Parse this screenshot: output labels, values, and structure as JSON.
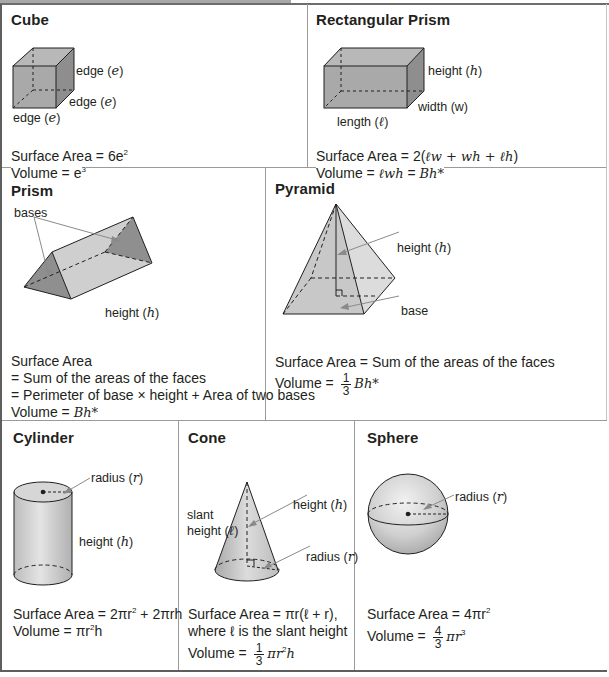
{
  "sheet": {
    "colors": {
      "shape_fill": "#a9a9a9",
      "shape_fill_light": "#d4d4d4",
      "shape_fill_dark": "#8c8c8c",
      "line": "#231f20",
      "arrow": "#8a8a8a",
      "border": "#5e5e5e",
      "divider": "#9a9a9a"
    }
  },
  "cube": {
    "title": "Cube",
    "labels": {
      "edge_right": "edge (",
      "edge_mid": "edge (",
      "edge_bottom": "edge (",
      "var": "e",
      "close": ")"
    },
    "surface_area": {
      "prefix": "Surface Area = 6e",
      "exp": "2"
    },
    "volume": {
      "prefix": "Volume = e",
      "exp": "3"
    }
  },
  "rect_prism": {
    "title": "Rectangular Prism",
    "labels": {
      "height": "height (",
      "height_var": "h",
      "width": "width (w)",
      "length": "length (",
      "length_var": "ℓ",
      "close": ")"
    },
    "surface_area": {
      "prefix": "Surface Area = 2(",
      "expr": "ℓw + wh + ℓh",
      "suffix": ")"
    },
    "volume": {
      "prefix": "Volume = ",
      "expr": "ℓwh",
      "eq": " = ",
      "bh": "Bh*"
    }
  },
  "prism": {
    "title": "Prism",
    "labels": {
      "bases": "bases",
      "height": "height (",
      "height_var": "h",
      "close": ")"
    },
    "surface_area": {
      "line1": "Surface Area",
      "line2": "= Sum of the areas of the faces",
      "line3": "= Perimeter of base × height + Area of two bases"
    },
    "volume": {
      "prefix": "Volume = ",
      "bh": "Bh*"
    }
  },
  "pyramid": {
    "title": "Pyramid",
    "labels": {
      "height": "height (",
      "height_var": "h",
      "base": "base",
      "close": ")"
    },
    "surface_area": {
      "text": "Surface Area = Sum of the areas of the faces"
    },
    "volume": {
      "prefix": "Volume = ",
      "num": "1",
      "den": "3",
      "bh": "Bh*"
    }
  },
  "cylinder": {
    "title": "Cylinder",
    "labels": {
      "radius": "radius (",
      "radius_var": "r",
      "height": "height (",
      "height_var": "h",
      "close": ")"
    },
    "surface_area": {
      "prefix": "Surface Area = 2πr",
      "exp": "2",
      "suffix": " + 2πrh"
    },
    "volume": {
      "prefix": "Volume = πr",
      "exp": "2",
      "suffix": "h"
    }
  },
  "cone": {
    "title": "Cone",
    "labels": {
      "slant1": "slant",
      "slant2": "height (",
      "slant_var": "ℓ",
      "height": "height (",
      "height_var": "h",
      "radius": "radius (",
      "radius_var": "r",
      "close": ")"
    },
    "surface_area": {
      "line1": "Surface Area = πr(ℓ + r),",
      "line2": "where ℓ is the slant height"
    },
    "volume": {
      "prefix": "Volume = ",
      "num": "1",
      "den": "3",
      "expr": "πr",
      "exp": "2",
      "suffix": "h"
    }
  },
  "sphere": {
    "title": "Sphere",
    "labels": {
      "radius": "radius (",
      "radius_var": "r",
      "close": ")"
    },
    "surface_area": {
      "prefix": "Surface Area = 4πr",
      "exp": "2"
    },
    "volume": {
      "prefix": "Volume = ",
      "num": "4",
      "den": "3",
      "expr": "πr",
      "exp": "3"
    }
  }
}
